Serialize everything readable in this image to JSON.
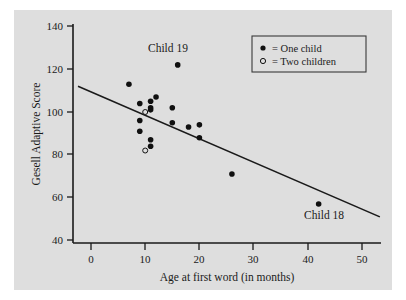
{
  "figure": {
    "background": "#ffffff",
    "panel_background": "#dedede",
    "ink_color": "#101010"
  },
  "chart_data": {
    "type": "scatter",
    "title": "",
    "xlabel": "Age at first word (in months)",
    "ylabel": "Gesell Adaptive Score",
    "xlim": [
      -3,
      55
    ],
    "ylim": [
      36,
      142
    ],
    "xticks": [
      0,
      10,
      20,
      30,
      40,
      50
    ],
    "xtick_labels": [
      "0",
      "10",
      "20",
      "30",
      "40",
      "50"
    ],
    "yticks": [
      40,
      60,
      80,
      100,
      120,
      140
    ],
    "ytick_labels": [
      "40",
      "60",
      "80",
      "100",
      "120",
      "140"
    ],
    "grid": false,
    "legend_position": "top-right",
    "legend": [
      {
        "marker": "filled-circle",
        "label": "= One child"
      },
      {
        "marker": "open-circle",
        "label": "= Two children"
      }
    ],
    "series": [
      {
        "name": "One child",
        "marker": "filled-circle",
        "points": [
          {
            "x": 7,
            "y": 113
          },
          {
            "x": 9,
            "y": 104
          },
          {
            "x": 9,
            "y": 96
          },
          {
            "x": 9,
            "y": 91
          },
          {
            "x": 11,
            "y": 102
          },
          {
            "x": 11,
            "y": 105
          },
          {
            "x": 11,
            "y": 101
          },
          {
            "x": 11,
            "y": 84
          },
          {
            "x": 11,
            "y": 87
          },
          {
            "x": 12,
            "y": 107
          },
          {
            "x": 15,
            "y": 95
          },
          {
            "x": 15,
            "y": 102
          },
          {
            "x": 16,
            "y": 122
          },
          {
            "x": 18,
            "y": 93
          },
          {
            "x": 20,
            "y": 94
          },
          {
            "x": 20,
            "y": 88
          },
          {
            "x": 26,
            "y": 71
          },
          {
            "x": 42,
            "y": 57
          }
        ]
      },
      {
        "name": "Two children",
        "marker": "open-circle",
        "points": [
          {
            "x": 10,
            "y": 100
          },
          {
            "x": 10,
            "y": 82
          }
        ]
      }
    ],
    "regression_line": {
      "x_start": -2.4,
      "y_start": 112,
      "x_end": 53.3,
      "y_end": 51
    },
    "annotations": [
      {
        "label": "Child 19",
        "x": 14.2,
        "y": 128,
        "anchor": "middle"
      },
      {
        "label": "Child 18",
        "x": 43.0,
        "y": 50,
        "anchor": "middle"
      }
    ]
  }
}
